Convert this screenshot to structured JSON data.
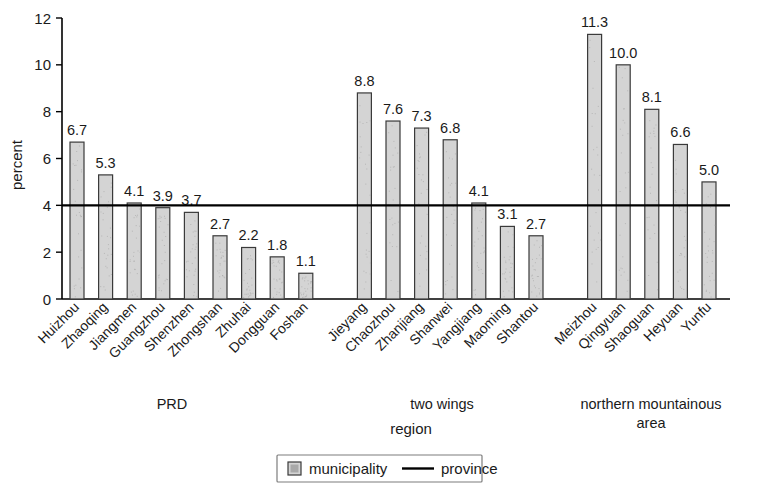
{
  "chart_data": {
    "type": "bar",
    "title": "",
    "xlabel": "region",
    "ylabel": "percent",
    "ylim": [
      0,
      12
    ],
    "ytick_values": [
      0,
      2,
      4,
      6,
      8,
      10,
      12
    ],
    "ytick_labels": [
      "0",
      "2",
      "4",
      "6",
      "8",
      "10",
      "12"
    ],
    "grid": false,
    "legend_position": "bottom",
    "categories": [
      "Huizhou",
      "Zhaoqing",
      "Jiangmen",
      "Guangzhou",
      "Shenzhen",
      "Zhongshan",
      "Zhuhai",
      "Dongguan",
      "Foshan",
      "Jieyang",
      "Chaozhou",
      "Zhanjiang",
      "Shanwei",
      "Yangjiang",
      "Maoming",
      "Shantou",
      "Meizhou",
      "Qingyuan",
      "Shaoguan",
      "Heyuan",
      "Yunfu"
    ],
    "values": [
      6.7,
      5.3,
      4.1,
      3.9,
      3.7,
      2.7,
      2.2,
      1.8,
      1.1,
      8.8,
      7.6,
      7.3,
      6.8,
      4.1,
      3.1,
      2.7,
      11.3,
      10.0,
      8.1,
      6.6,
      5.0
    ],
    "value_labels": [
      "6.7",
      "5.3",
      "4.1",
      "3.9",
      "3.7",
      "2.7",
      "2.2",
      "1.8",
      "1.1",
      "8.8",
      "7.6",
      "7.3",
      "6.8",
      "4.1",
      "3.1",
      "2.7",
      "11.3",
      "10.0",
      "8.1",
      "6.6",
      "5.0"
    ],
    "groups": [
      {
        "label": "PRD",
        "start": 0,
        "count": 9
      },
      {
        "label": "two wings",
        "start": 9,
        "count": 7
      },
      {
        "label": "northern mountainous\narea",
        "start": 16,
        "count": 5
      }
    ],
    "reference_line": {
      "name": "province",
      "value": 4.0
    },
    "series": [
      {
        "name": "municipality",
        "values": [
          6.7,
          5.3,
          4.1,
          3.9,
          3.7,
          2.7,
          2.2,
          1.8,
          1.1,
          8.8,
          7.6,
          7.3,
          6.8,
          4.1,
          3.1,
          2.7,
          11.3,
          10.0,
          8.1,
          6.6,
          5.0
        ]
      }
    ],
    "colors": {
      "bar_fill": "#d4d4d4",
      "bar_stroke": "#3a3a3a",
      "province_line": "#000000",
      "axis": "#000000"
    }
  },
  "group_labels": {
    "prd": "PRD",
    "two_wings": "two wings",
    "northern_line1": "northern mountainous",
    "northern_line2": "area"
  },
  "axis": {
    "y_title": "percent",
    "x_title": "region"
  },
  "legend": {
    "municipality_label": "municipality",
    "province_label": "province"
  }
}
